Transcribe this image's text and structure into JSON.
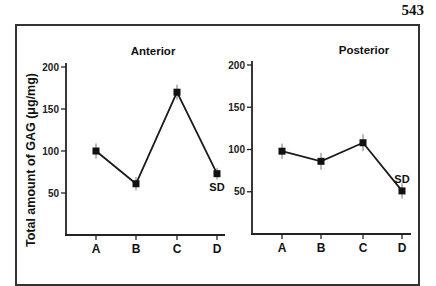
{
  "page_number": "543",
  "chart_data": [
    {
      "type": "line",
      "title": "Anterior",
      "xlabel": "",
      "ylabel": "Total amount of GAG (μg/mg)",
      "categories": [
        "A",
        "B",
        "C",
        "D"
      ],
      "values": [
        100,
        61,
        170,
        73
      ],
      "error": [
        9,
        8,
        9,
        7
      ],
      "ylim": [
        0,
        200
      ],
      "yticks": [
        50,
        100,
        150,
        200
      ],
      "grid": false,
      "annotations": [
        {
          "text": "SD",
          "at": "D",
          "position": "below"
        }
      ]
    },
    {
      "type": "line",
      "title": "Posterior",
      "xlabel": "",
      "ylabel": "",
      "categories": [
        "A",
        "B",
        "C",
        "D"
      ],
      "values": [
        98,
        86,
        108,
        51
      ],
      "error": [
        9,
        10,
        10,
        9
      ],
      "ylim": [
        0,
        200
      ],
      "yticks": [
        50,
        100,
        150,
        200
      ],
      "grid": false,
      "annotations": [
        {
          "text": "SD",
          "at": "D",
          "position": "above"
        }
      ]
    }
  ],
  "shared_ylabel": "Total amount of GAG (μg/mg)"
}
